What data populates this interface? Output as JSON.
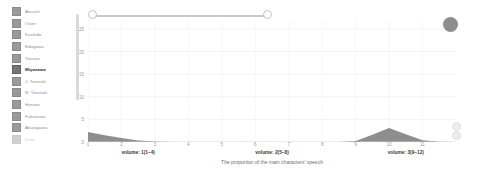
{
  "legend": {
    "title": "characters",
    "items": [
      {
        "label": "Atsushi",
        "color": "#9a9a9a",
        "active": false
      },
      {
        "label": "Osier",
        "color": "#9a9a9a",
        "active": false
      },
      {
        "label": "Kushida",
        "color": "#9a9a9a",
        "active": false
      },
      {
        "label": "Edogawa",
        "color": "#9a9a9a",
        "active": false
      },
      {
        "label": "Yosano",
        "color": "#9a9a9a",
        "active": false
      },
      {
        "label": "Miyazawa",
        "color": "#767676",
        "active": true
      },
      {
        "label": "J. Tanizaki",
        "color": "#9a9a9a",
        "active": false
      },
      {
        "label": "N. Tanizaki",
        "color": "#9a9a9a",
        "active": false
      },
      {
        "label": "Haruno",
        "color": "#9a9a9a",
        "active": false
      },
      {
        "label": "Fukuzawa",
        "color": "#9a9a9a",
        "active": false
      },
      {
        "label": "Akutagawa",
        "color": "#9a9a9a",
        "active": false
      },
      {
        "label": "Kenji",
        "color": "#9a9a9a",
        "active": false
      }
    ]
  },
  "slider": {
    "name": "chapter-range-slider",
    "min_handle_label": "",
    "max_handle_label": ""
  },
  "controls": {
    "primary_label": "",
    "secondary_top_label": "",
    "secondary_bottom_label": ""
  },
  "caption": "The proportion of the main characters' speech",
  "chart_data": {
    "type": "area",
    "title": "",
    "subtitle": "",
    "xlabel": "",
    "ylabel": "",
    "xlim": [
      1,
      12
    ],
    "ylim": [
      0,
      27
    ],
    "grid": true,
    "legend_position": "left",
    "x_tick_labels": [
      "1",
      "2",
      "3",
      "4",
      "5",
      "6",
      "7",
      "8",
      "9",
      "10",
      "11"
    ],
    "x_tick_values": [
      1,
      2,
      3,
      4,
      5,
      6,
      7,
      8,
      9,
      10,
      11
    ],
    "y_tick_labels": [
      "25",
      "20",
      "15",
      "10",
      "5",
      "0"
    ],
    "y_tick_values": [
      25,
      20,
      15,
      10,
      5,
      0
    ],
    "group_labels": [
      {
        "label": "volume: 1(1–4)",
        "center_x": 2.5
      },
      {
        "label": "volume: 2(5–8)",
        "center_x": 6.5
      },
      {
        "label": "volume: 3(9–12)",
        "center_x": 10.5
      }
    ],
    "x": [
      1,
      1.5,
      2,
      2.5,
      3,
      3.5,
      4,
      4.5,
      5,
      5.5,
      6,
      6.5,
      7,
      7.5,
      8,
      8.5,
      9,
      9.5,
      10,
      10.5,
      11,
      11.5,
      12
    ],
    "series": [
      {
        "name": "Miyazawa",
        "color": "#8e8e8e",
        "values": [
          2.2,
          1.5,
          0.9,
          0.35,
          0.1,
          0,
          0,
          0,
          0,
          0,
          0,
          0,
          0,
          0,
          0,
          0,
          0.2,
          1.6,
          3.1,
          1.7,
          0.4,
          0.05,
          0
        ]
      }
    ]
  }
}
